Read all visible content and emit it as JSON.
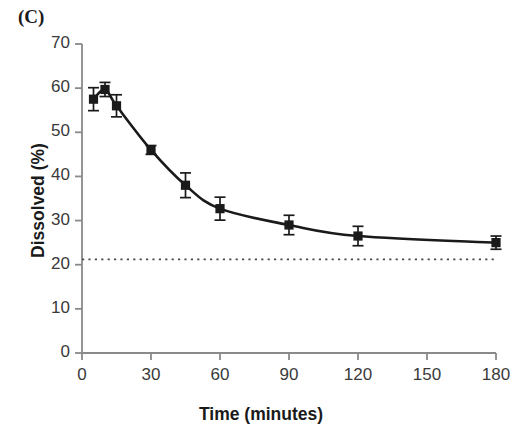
{
  "panel": {
    "label": "(C)"
  },
  "axes": {
    "xlabel": "Time (minutes)",
    "ylabel": "Dissolved (%)"
  },
  "colors": {
    "axis": "#8a8a8a",
    "data": "#1a1a1a",
    "reference_line": "#4d4d4d",
    "background": "#ffffff",
    "text": "#1a1a1a"
  },
  "chart_data": {
    "type": "line",
    "title": "(C)",
    "xlabel": "Time (minutes)",
    "ylabel": "Dissolved (%)",
    "xlim": [
      0,
      180
    ],
    "ylim": [
      0,
      70
    ],
    "xticks": [
      0,
      30,
      60,
      90,
      120,
      150,
      180
    ],
    "yticks": [
      0,
      10,
      20,
      30,
      40,
      50,
      60,
      70
    ],
    "xtick_labels": [
      "0",
      "30",
      "60",
      "90",
      "120",
      "150",
      "180"
    ],
    "ytick_labels": [
      "0",
      "10",
      "20",
      "30",
      "40",
      "50",
      "60",
      "70"
    ],
    "grid": false,
    "legend": "none",
    "marker": "filled-square",
    "error_bars": "yes",
    "x": [
      5,
      10,
      15,
      30,
      45,
      60,
      90,
      120,
      180
    ],
    "values": [
      57.5,
      59.7,
      56.0,
      46.0,
      38.0,
      32.7,
      29.0,
      26.5,
      25.0
    ],
    "errors": [
      2.6,
      1.6,
      2.5,
      1.0,
      2.8,
      2.6,
      2.2,
      2.2,
      1.5
    ],
    "series": [
      {
        "name": "Dissolved (%)",
        "x": [
          5,
          10,
          15,
          30,
          45,
          60,
          90,
          120,
          180
        ],
        "values": [
          57.5,
          59.7,
          56.0,
          46.0,
          38.0,
          32.7,
          29.0,
          26.5,
          25.0
        ],
        "errors": [
          2.6,
          1.6,
          2.5,
          1.0,
          2.8,
          2.6,
          2.2,
          2.2,
          1.5
        ]
      }
    ],
    "annotations": [
      {
        "type": "horizontal-dotted-line",
        "y": 21.2,
        "label": "reference level"
      }
    ]
  }
}
